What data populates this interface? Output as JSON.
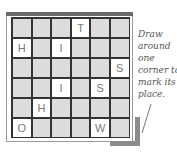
{
  "grid": {
    "rows": 6,
    "cols": 6,
    "cells": [
      [
        "",
        "",
        "",
        "T",
        "",
        ""
      ],
      [
        "H",
        "",
        "I",
        "",
        "",
        ""
      ],
      [
        "",
        "",
        "",
        "",
        "",
        "S"
      ],
      [
        "",
        "",
        "I",
        "",
        "S",
        ""
      ],
      [
        "",
        "H",
        "",
        "",
        "",
        ""
      ],
      [
        "O",
        "",
        "",
        "",
        "W",
        ""
      ]
    ]
  },
  "note": {
    "lines": [
      "Draw",
      "around",
      "one",
      "corner to",
      "mark its",
      "place."
    ]
  },
  "colors": {
    "cell_fill": "#dcdcdc",
    "lit_fill": "#ffffff",
    "letter": "#7a7a7a",
    "frame_bar": "#6a6a6a",
    "shadow": "#8c8c8c"
  }
}
